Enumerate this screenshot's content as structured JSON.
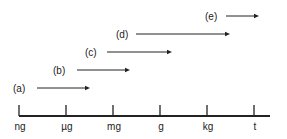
{
  "axis": {
    "ticks": [
      {
        "label": "ng",
        "x": 19
      },
      {
        "label": "µg",
        "x": 66
      },
      {
        "label": "mg",
        "x": 113
      },
      {
        "label": "g",
        "x": 160
      },
      {
        "label": "kg",
        "x": 207
      },
      {
        "label": "t",
        "x": 254
      }
    ]
  },
  "ranges": [
    {
      "label": "(a)",
      "label_x": 13,
      "y": 88,
      "x1": 37,
      "x2": 90
    },
    {
      "label": "(b)",
      "label_x": 53,
      "y": 70,
      "x1": 77,
      "x2": 130
    },
    {
      "label": "(c)",
      "label_x": 85,
      "y": 52,
      "x1": 107,
      "x2": 172
    },
    {
      "label": "(d)",
      "label_x": 116,
      "y": 34,
      "x1": 136,
      "x2": 230
    },
    {
      "label": "(e)",
      "label_x": 205,
      "y": 16,
      "x1": 226,
      "x2": 259
    }
  ],
  "colors": {
    "line": "#222222"
  }
}
